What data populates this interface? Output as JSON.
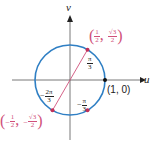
{
  "diagram": {
    "axes": {
      "horizontal_label": "u",
      "vertical_label": "v"
    },
    "circle": {
      "type": "unit circle",
      "color": "#2f7fc4"
    },
    "chord": {
      "color": "#d0507a",
      "from": "(-1/2, -√3/2)",
      "to": "(1/2, √3/2)"
    },
    "points": {
      "top_right": {
        "x_num": "1",
        "x_den": "2",
        "y_num": "√3",
        "y_den": "2",
        "color": "#c0305a"
      },
      "bottom_left": {
        "x_sign": "−",
        "x_num": "1",
        "x_den": "2",
        "y_sign": "−",
        "y_num": "√3",
        "y_den": "2",
        "color": "#c0305a"
      },
      "bottom_right": {
        "color": "#c0305a"
      },
      "unit": {
        "label": "(1, 0)",
        "color": "#111111"
      }
    },
    "angles": {
      "pi_over_3": {
        "num": "π",
        "den": "3"
      },
      "neg_two_pi_over_3": {
        "sign": "−",
        "num": "2π",
        "den": "3"
      },
      "neg_pi_over_3": {
        "sign": "−",
        "num": "π",
        "den": "3"
      }
    }
  }
}
